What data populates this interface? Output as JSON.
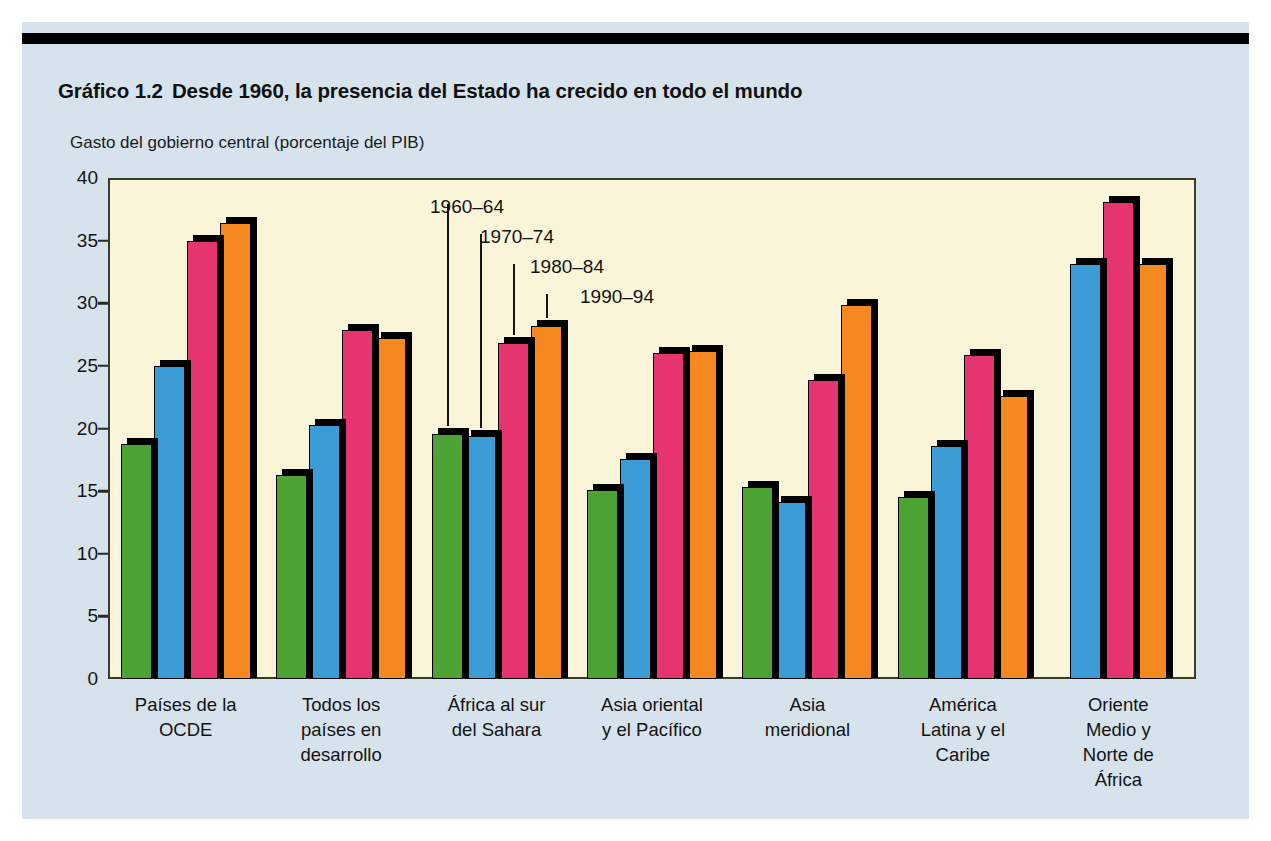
{
  "figure": {
    "number": "Gráfico 1.2",
    "title": "Desde 1960, la presencia del Estado ha crecido en todo el mundo",
    "axis_caption": "Gasto del gobierno central (porcentaje del PIB)"
  },
  "colors": {
    "series_1960_64": "#4CA333",
    "series_1970_74": "#3A9BD5",
    "series_1980_84": "#E5346F",
    "series_1990_94": "#F5881F",
    "plot_background": "#FAF5D8",
    "page_background": "#D7E3EC",
    "axis": "#2A2A20"
  },
  "chart_data": {
    "type": "bar",
    "xlabel": "",
    "ylabel": "Gasto del gobierno central (porcentaje del PIB)",
    "ylim": [
      0,
      40
    ],
    "yticks": [
      0,
      5,
      10,
      15,
      20,
      25,
      30,
      35,
      40
    ],
    "grid": false,
    "legend_position": "inside-upper-center",
    "categories": [
      "Países de la\nOCDE",
      "Todos los\npaíses en\ndesarrollo",
      "África al sur\ndel Sahara",
      "Asia oriental\ny el Pacífico",
      "Asia\nmeridional",
      "América\nLatina y el\nCaribe",
      "Oriente\nMedio y\nNorte de\nÁfrica"
    ],
    "series": [
      {
        "name": "1960–64",
        "color": "#4CA333",
        "values": [
          18.8,
          16.3,
          19.6,
          15.1,
          15.3,
          14.5,
          null
        ]
      },
      {
        "name": "1970–74",
        "color": "#3A9BD5",
        "values": [
          25.0,
          20.3,
          19.4,
          17.6,
          14.1,
          18.6,
          33.1
        ]
      },
      {
        "name": "1980–84",
        "color": "#E5346F",
        "values": [
          35.0,
          27.9,
          26.8,
          26.0,
          23.9,
          25.9,
          38.1
        ]
      },
      {
        "name": "1990–94",
        "color": "#F5881F",
        "values": [
          36.4,
          27.2,
          28.2,
          26.2,
          29.9,
          22.6,
          33.1
        ]
      }
    ]
  },
  "xaxis": {
    "labels": [
      [
        "Países de la",
        "OCDE"
      ],
      [
        "Todos los",
        "países en",
        "desarrollo"
      ],
      [
        "África al sur",
        "del Sahara"
      ],
      [
        "Asia oriental",
        "y el Pacífico"
      ],
      [
        "Asia",
        "meridional"
      ],
      [
        "América",
        "Latina y el",
        "Caribe"
      ],
      [
        "Oriente",
        "Medio y",
        "Norte de",
        "África"
      ]
    ]
  },
  "legend": {
    "items": [
      {
        "label": "1960–64"
      },
      {
        "label": "1970–74"
      },
      {
        "label": "1980–84"
      },
      {
        "label": "1990–94"
      }
    ]
  }
}
